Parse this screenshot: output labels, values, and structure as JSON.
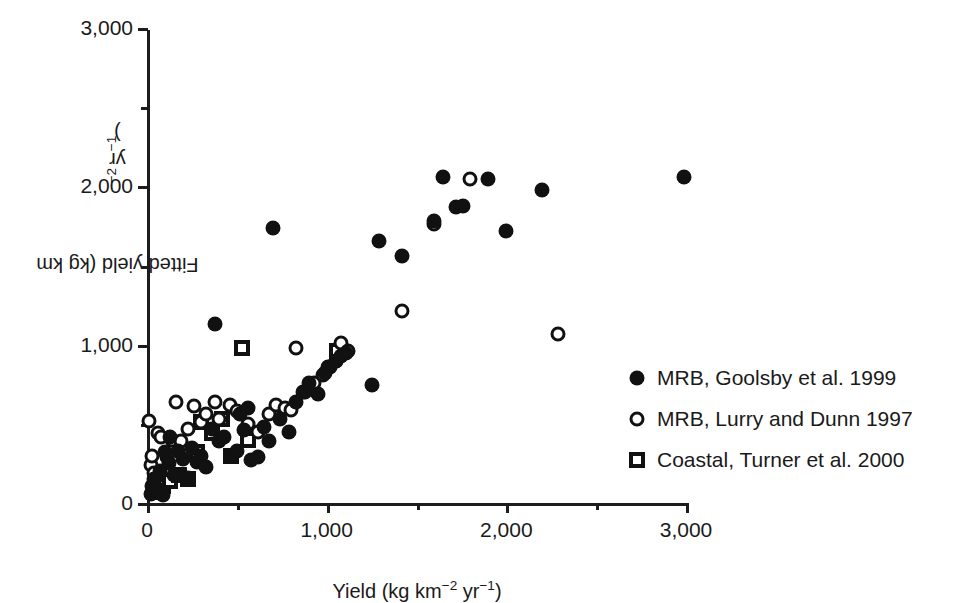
{
  "figure": {
    "background": "#ffffff",
    "foreground": "#111111"
  },
  "axes": {
    "x_title_prefix": "Yield (kg km",
    "x_title_sup1": "−2",
    "x_title_mid": " yr",
    "x_title_sup2": "−1",
    "x_title_suffix": ")",
    "y_title_prefix": "Fitted yield (kg km",
    "y_title_sup1": "−2",
    "y_title_mid": " yr",
    "y_title_sup2": "−1",
    "y_title_suffix": ")",
    "x_ticks": [
      {
        "value": 0,
        "label": "0",
        "major": true
      },
      {
        "value": 500,
        "label": "",
        "major": false
      },
      {
        "value": 1000,
        "label": "1,000",
        "major": true
      },
      {
        "value": 1500,
        "label": "",
        "major": false
      },
      {
        "value": 2000,
        "label": "2,000",
        "major": true
      },
      {
        "value": 2500,
        "label": "",
        "major": false
      },
      {
        "value": 3000,
        "label": "3,000",
        "major": true
      }
    ],
    "y_ticks": [
      {
        "value": 0,
        "label": "0",
        "major": true
      },
      {
        "value": 500,
        "label": "",
        "major": false
      },
      {
        "value": 1000,
        "label": "1,000",
        "major": true
      },
      {
        "value": 1500,
        "label": "",
        "major": false
      },
      {
        "value": 2000,
        "label": "2,000",
        "major": true
      },
      {
        "value": 2500,
        "label": "",
        "major": false
      },
      {
        "value": 3000,
        "label": "3,000",
        "major": true
      }
    ]
  },
  "legend": {
    "position": "right-middle",
    "entries": [
      {
        "marker": "filled-circle",
        "label": "MRB, Goolsby et al. 1999"
      },
      {
        "marker": "open-circle",
        "label": "MRB, Lurry and Dunn 1997"
      },
      {
        "marker": "open-square",
        "label": "Coastal, Turner et al. 2000"
      }
    ]
  },
  "chart_data": {
    "type": "scatter",
    "title": "",
    "xlabel": "Yield (kg km−2 yr−1)",
    "ylabel": "Fitted yield (kg km−2 yr−1)",
    "xlim": [
      0,
      3000
    ],
    "ylim": [
      0,
      3000
    ],
    "grid": false,
    "legend_position": "right",
    "series": [
      {
        "name": "MRB, Goolsby et al. 1999",
        "marker": "filled-circle",
        "points": [
          [
            20,
            60
          ],
          [
            30,
            110
          ],
          [
            40,
            150
          ],
          [
            60,
            90
          ],
          [
            70,
            200
          ],
          [
            90,
            50
          ],
          [
            100,
            320
          ],
          [
            120,
            250
          ],
          [
            130,
            420
          ],
          [
            150,
            180
          ],
          [
            170,
            330
          ],
          [
            200,
            280
          ],
          [
            230,
            160
          ],
          [
            250,
            350
          ],
          [
            280,
            260
          ],
          [
            300,
            300
          ],
          [
            330,
            230
          ],
          [
            360,
            470
          ],
          [
            380,
            1130
          ],
          [
            400,
            390
          ],
          [
            430,
            420
          ],
          [
            470,
            300
          ],
          [
            500,
            330
          ],
          [
            520,
            560
          ],
          [
            540,
            460
          ],
          [
            560,
            600
          ],
          [
            580,
            270
          ],
          [
            620,
            290
          ],
          [
            650,
            480
          ],
          [
            680,
            390
          ],
          [
            700,
            1735
          ],
          [
            740,
            530
          ],
          [
            790,
            450
          ],
          [
            830,
            640
          ],
          [
            870,
            700
          ],
          [
            900,
            760
          ],
          [
            950,
            690
          ],
          [
            990,
            820
          ],
          [
            1020,
            860
          ],
          [
            1050,
            900
          ],
          [
            1080,
            930
          ],
          [
            1110,
            950
          ],
          [
            1250,
            745
          ],
          [
            1290,
            1655
          ],
          [
            1420,
            1560
          ],
          [
            1600,
            1780
          ],
          [
            1650,
            2060
          ],
          [
            1720,
            1870
          ],
          [
            1760,
            1875
          ],
          [
            1900,
            2045
          ],
          [
            2000,
            1715
          ],
          [
            2200,
            1975
          ],
          [
            2990,
            2060
          ]
        ]
      },
      {
        "name": "MRB, Lurry and Dunn 1997",
        "marker": "open-circle",
        "points": [
          [
            10,
            520
          ],
          [
            20,
            240
          ],
          [
            30,
            300
          ],
          [
            40,
            190
          ],
          [
            60,
            440
          ],
          [
            80,
            420
          ],
          [
            110,
            290
          ],
          [
            140,
            400
          ],
          [
            160,
            640
          ],
          [
            190,
            390
          ],
          [
            230,
            470
          ],
          [
            260,
            610
          ],
          [
            300,
            510
          ],
          [
            330,
            560
          ],
          [
            380,
            640
          ],
          [
            400,
            530
          ],
          [
            460,
            620
          ],
          [
            500,
            580
          ],
          [
            560,
            500
          ],
          [
            620,
            450
          ],
          [
            680,
            560
          ],
          [
            720,
            620
          ],
          [
            770,
            600
          ],
          [
            800,
            590
          ],
          [
            830,
            980
          ],
          [
            880,
            700
          ],
          [
            930,
            760
          ],
          [
            980,
            810
          ],
          [
            1010,
            860
          ],
          [
            1050,
            900
          ],
          [
            1080,
            1010
          ],
          [
            1120,
            960
          ],
          [
            1420,
            1215
          ],
          [
            1600,
            1760
          ],
          [
            1800,
            2045
          ],
          [
            2290,
            1070
          ]
        ]
      },
      {
        "name": "Coastal, Turner et al. 2000",
        "marker": "open-square",
        "points": [
          [
            40,
            70
          ],
          [
            90,
            110
          ],
          [
            130,
            140
          ],
          [
            180,
            175
          ],
          [
            230,
            150
          ],
          [
            280,
            320
          ],
          [
            300,
            510
          ],
          [
            360,
            440
          ],
          [
            420,
            530
          ],
          [
            470,
            300
          ],
          [
            530,
            980
          ],
          [
            560,
            400
          ],
          [
            1060,
            960
          ]
        ]
      }
    ]
  },
  "caption": {
    "partial_text": ""
  }
}
